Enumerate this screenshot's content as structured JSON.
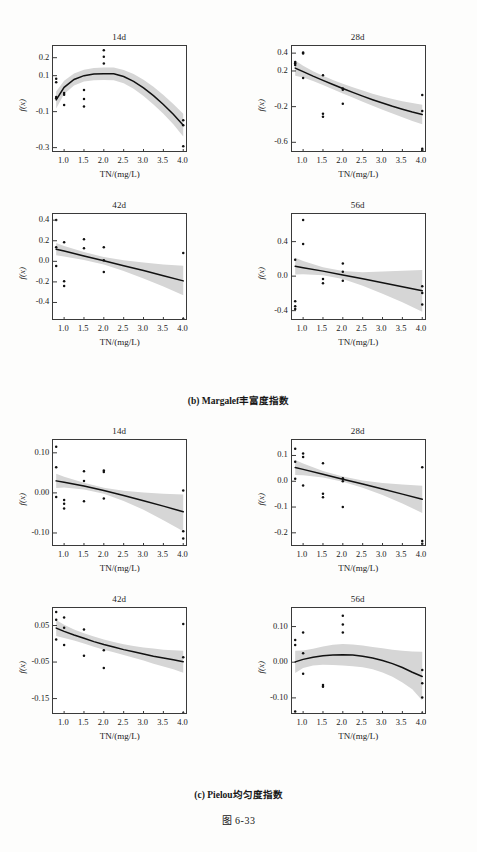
{
  "figure": {
    "number": "图 6-33",
    "sections": [
      {
        "id": "b",
        "caption": "(b) Margalef丰富度指数"
      },
      {
        "id": "c",
        "caption": "(c) Pielou均匀度指数"
      }
    ]
  },
  "axes_common": {
    "xlabel": "TN/(mg/L)",
    "ylabel": "f(x)",
    "xticks": [
      "1.0",
      "1.5",
      "2.0",
      "2.5",
      "3.0",
      "3.5",
      "4.0"
    ],
    "xtick_values": [
      1.0,
      1.5,
      2.0,
      2.5,
      3.0,
      3.5,
      4.0
    ],
    "xlim": [
      0.72,
      4.12
    ]
  },
  "style": {
    "band_color": "#d6d6d6",
    "curve_color": "#111111",
    "point_color": "#111111",
    "frame_color": "#3a3a3a",
    "page_bg": "#fdfdfc"
  },
  "chart_data": [
    {
      "id": "b-14d",
      "type": "line",
      "title": "14d",
      "section": "(b) Margalef丰富度指数",
      "xlabel": "TN/(mg/L)",
      "ylabel": "f(x)",
      "xlim": [
        0.72,
        4.12
      ],
      "ylim": [
        -0.33,
        0.265
      ],
      "yticks": [
        0.2,
        0.1,
        -0.1,
        -0.3
      ],
      "ytick_labels": [
        "0.2",
        "0.1",
        "-0.1",
        "-0.3"
      ],
      "grid": false,
      "legend": "none",
      "fit": {
        "shape": "quadratic-concave",
        "x": [
          0.8,
          1.0,
          1.25,
          1.5,
          1.75,
          2.0,
          2.25,
          2.5,
          2.75,
          3.0,
          3.25,
          3.5,
          3.75,
          4.0
        ],
        "y": [
          -0.035,
          0.035,
          0.079,
          0.1,
          0.109,
          0.111,
          0.11,
          0.095,
          0.068,
          0.032,
          -0.011,
          -0.06,
          -0.114,
          -0.175
        ]
      },
      "band_upper": [
        0.012,
        0.072,
        0.112,
        0.133,
        0.143,
        0.146,
        0.145,
        0.132,
        0.109,
        0.077,
        0.038,
        -0.008,
        -0.058,
        -0.112
      ],
      "band_lower": [
        -0.082,
        -0.002,
        0.046,
        0.067,
        0.075,
        0.076,
        0.075,
        0.058,
        0.027,
        -0.013,
        -0.06,
        -0.112,
        -0.17,
        -0.238
      ],
      "points": [
        {
          "x": 0.8,
          "y": 0.083
        },
        {
          "x": 0.8,
          "y": 0.063
        },
        {
          "x": 0.8,
          "y": -0.018
        },
        {
          "x": 0.8,
          "y": -0.026
        },
        {
          "x": 1.0,
          "y": 0.004
        },
        {
          "x": 1.0,
          "y": -0.006
        },
        {
          "x": 1.0,
          "y": -0.063
        },
        {
          "x": 1.5,
          "y": 0.02
        },
        {
          "x": 1.5,
          "y": -0.03
        },
        {
          "x": 1.5,
          "y": -0.072
        },
        {
          "x": 2.0,
          "y": 0.242
        },
        {
          "x": 2.0,
          "y": 0.205
        },
        {
          "x": 2.0,
          "y": 0.168
        },
        {
          "x": 4.0,
          "y": -0.148
        },
        {
          "x": 4.0,
          "y": -0.175
        },
        {
          "x": 4.0,
          "y": -0.292
        }
      ]
    },
    {
      "id": "b-28d",
      "type": "line",
      "title": "28d",
      "section": "(b) Margalef丰富度指数",
      "xlabel": "TN/(mg/L)",
      "ylabel": "f(x)",
      "xlim": [
        0.72,
        4.12
      ],
      "ylim": [
        -0.72,
        0.48
      ],
      "yticks": [
        0.4,
        0.2,
        -0.2,
        -0.6
      ],
      "ytick_labels": [
        "0.4",
        "0.2",
        "-0.2",
        "-0.6"
      ],
      "grid": false,
      "legend": "none",
      "fit": {
        "shape": "monotone-decreasing-convex",
        "x": [
          0.8,
          1.0,
          1.25,
          1.5,
          1.75,
          2.0,
          2.25,
          2.5,
          2.75,
          3.0,
          3.25,
          3.5,
          3.75,
          4.0
        ],
        "y": [
          0.232,
          0.192,
          0.142,
          0.095,
          0.048,
          0.003,
          -0.04,
          -0.082,
          -0.122,
          -0.16,
          -0.196,
          -0.229,
          -0.26,
          -0.288
        ]
      },
      "band_upper": [
        0.318,
        0.258,
        0.196,
        0.146,
        0.1,
        0.058,
        0.018,
        -0.02,
        -0.055,
        -0.086,
        -0.114,
        -0.139,
        -0.16,
        -0.178
      ],
      "band_lower": [
        0.146,
        0.126,
        0.088,
        0.044,
        -0.004,
        -0.052,
        -0.098,
        -0.144,
        -0.189,
        -0.234,
        -0.278,
        -0.319,
        -0.36,
        -0.398
      ],
      "points": [
        {
          "x": 0.8,
          "y": 0.3
        },
        {
          "x": 0.8,
          "y": 0.286
        },
        {
          "x": 0.8,
          "y": 0.266
        },
        {
          "x": 1.0,
          "y": 0.408
        },
        {
          "x": 1.0,
          "y": 0.396
        },
        {
          "x": 1.0,
          "y": 0.122
        },
        {
          "x": 1.5,
          "y": 0.152
        },
        {
          "x": 1.5,
          "y": -0.28
        },
        {
          "x": 1.5,
          "y": -0.314
        },
        {
          "x": 2.0,
          "y": 0.004
        },
        {
          "x": 2.0,
          "y": -0.01
        },
        {
          "x": 2.0,
          "y": -0.168
        },
        {
          "x": 4.0,
          "y": -0.07
        },
        {
          "x": 4.0,
          "y": -0.25
        },
        {
          "x": 4.0,
          "y": -0.672
        },
        {
          "x": 4.0,
          "y": -0.69
        }
      ]
    },
    {
      "id": "b-42d",
      "type": "line",
      "title": "42d",
      "section": "(b) Margalef丰富度指数",
      "xlabel": "TN/(mg/L)",
      "ylabel": "f(x)",
      "xlim": [
        0.72,
        4.12
      ],
      "ylim": [
        -0.58,
        0.46
      ],
      "yticks": [
        0.4,
        0.2,
        0.0,
        -0.2,
        -0.4
      ],
      "ytick_labels": [
        "0.4",
        "0.2",
        "0.0",
        "-0.2",
        "-0.4"
      ],
      "grid": false,
      "legend": "none",
      "fit": {
        "shape": "linear-decreasing",
        "x": [
          0.8,
          1.0,
          1.5,
          2.0,
          2.5,
          3.0,
          3.5,
          4.0
        ],
        "y": [
          0.118,
          0.1,
          0.052,
          0.006,
          -0.042,
          -0.09,
          -0.14,
          -0.19
        ]
      },
      "band_upper": [
        0.178,
        0.15,
        0.09,
        0.042,
        0.01,
        -0.012,
        -0.03,
        -0.044
      ],
      "band_lower": [
        0.06,
        0.048,
        0.012,
        -0.03,
        -0.094,
        -0.166,
        -0.244,
        -0.33
      ],
      "points": [
        {
          "x": 0.8,
          "y": 0.402
        },
        {
          "x": 0.8,
          "y": 0.138
        },
        {
          "x": 0.8,
          "y": -0.046
        },
        {
          "x": 1.0,
          "y": 0.186
        },
        {
          "x": 1.0,
          "y": -0.194
        },
        {
          "x": 1.0,
          "y": -0.24
        },
        {
          "x": 1.5,
          "y": 0.214
        },
        {
          "x": 1.5,
          "y": 0.126
        },
        {
          "x": 2.0,
          "y": 0.136
        },
        {
          "x": 2.0,
          "y": 0.01
        },
        {
          "x": 2.0,
          "y": -0.104
        },
        {
          "x": 4.0,
          "y": 0.08
        },
        {
          "x": 4.0,
          "y": -0.56
        }
      ]
    },
    {
      "id": "b-56d",
      "type": "line",
      "title": "56d",
      "section": "(b) Margalef丰富度指数",
      "xlabel": "TN/(mg/L)",
      "ylabel": "f(x)",
      "xlim": [
        0.72,
        4.12
      ],
      "ylim": [
        -0.52,
        0.72
      ],
      "yticks": [
        0.4,
        0.0,
        -0.4
      ],
      "ytick_labels": [
        "0.4",
        "0.0",
        "-0.4"
      ],
      "grid": false,
      "legend": "none",
      "fit": {
        "shape": "linear-decreasing",
        "x": [
          0.8,
          1.0,
          1.5,
          2.0,
          2.5,
          3.0,
          3.5,
          4.0
        ],
        "y": [
          0.114,
          0.098,
          0.058,
          0.014,
          -0.03,
          -0.076,
          -0.122,
          -0.17
        ]
      },
      "band_upper": [
        0.212,
        0.176,
        0.104,
        0.058,
        0.046,
        0.054,
        0.062,
        0.07
      ],
      "band_lower": [
        0.02,
        0.022,
        0.01,
        -0.034,
        -0.112,
        -0.204,
        -0.304,
        -0.412
      ],
      "points": [
        {
          "x": 0.8,
          "y": 0.19
        },
        {
          "x": 0.8,
          "y": -0.29
        },
        {
          "x": 0.8,
          "y": -0.35
        },
        {
          "x": 0.8,
          "y": -0.382
        },
        {
          "x": 1.0,
          "y": 0.65
        },
        {
          "x": 1.0,
          "y": 0.372
        },
        {
          "x": 1.5,
          "y": -0.034
        },
        {
          "x": 1.5,
          "y": -0.082
        },
        {
          "x": 2.0,
          "y": 0.146
        },
        {
          "x": 2.0,
          "y": 0.05
        },
        {
          "x": 2.0,
          "y": -0.054
        },
        {
          "x": 4.0,
          "y": -0.118
        },
        {
          "x": 4.0,
          "y": -0.196
        },
        {
          "x": 4.0,
          "y": -0.33
        }
      ]
    },
    {
      "id": "c-14d",
      "type": "line",
      "title": "14d",
      "section": "(c) Pielou均匀度指数",
      "xlabel": "TN/(mg/L)",
      "ylabel": "f(x)",
      "xlim": [
        0.72,
        4.12
      ],
      "ylim": [
        -0.135,
        0.132
      ],
      "yticks": [
        0.1,
        0.0,
        -0.1
      ],
      "ytick_labels": [
        "0.10",
        "0.00",
        "-0.10"
      ],
      "grid": false,
      "legend": "none",
      "fit": {
        "shape": "linear-decreasing",
        "x": [
          0.8,
          1.0,
          1.5,
          2.0,
          2.5,
          3.0,
          3.5,
          4.0
        ],
        "y": [
          0.03,
          0.0268,
          0.0172,
          0.0058,
          -0.0066,
          -0.0196,
          -0.033,
          -0.047
        ]
      },
      "band_upper": [
        0.048,
        0.04,
        0.0256,
        0.013,
        0.0056,
        0.001,
        -0.002,
        -0.004
      ],
      "band_lower": [
        0.012,
        0.0134,
        0.0086,
        -0.002,
        -0.02,
        -0.042,
        -0.068,
        -0.096
      ],
      "points": [
        {
          "x": 0.8,
          "y": 0.115
        },
        {
          "x": 0.8,
          "y": 0.064
        },
        {
          "x": 0.8,
          "y": -0.01
        },
        {
          "x": 1.0,
          "y": -0.018
        },
        {
          "x": 1.0,
          "y": -0.027
        },
        {
          "x": 1.0,
          "y": -0.039
        },
        {
          "x": 1.5,
          "y": 0.054
        },
        {
          "x": 1.5,
          "y": 0.03
        },
        {
          "x": 1.5,
          "y": -0.021
        },
        {
          "x": 2.0,
          "y": 0.056
        },
        {
          "x": 2.0,
          "y": 0.052
        },
        {
          "x": 2.0,
          "y": -0.014
        },
        {
          "x": 4.0,
          "y": 0.006
        },
        {
          "x": 4.0,
          "y": -0.096
        },
        {
          "x": 4.0,
          "y": -0.114
        }
      ]
    },
    {
      "id": "c-28d",
      "type": "line",
      "title": "28d",
      "section": "(c) Pielou均匀度指数",
      "xlabel": "TN/(mg/L)",
      "ylabel": "f(x)",
      "xlim": [
        0.72,
        4.12
      ],
      "ylim": [
        -0.255,
        0.16
      ],
      "yticks": [
        0.1,
        0.0,
        -0.1,
        -0.2
      ],
      "ytick_labels": [
        "0.1",
        "0.0",
        "-0.1",
        "-0.2"
      ],
      "grid": false,
      "legend": "none",
      "fit": {
        "shape": "linear-decreasing",
        "x": [
          0.8,
          1.0,
          1.5,
          2.0,
          2.5,
          3.0,
          3.5,
          4.0
        ],
        "y": [
          0.053,
          0.046,
          0.0272,
          0.008,
          -0.011,
          -0.03,
          -0.05,
          -0.07
        ]
      },
      "band_upper": [
        0.082,
        0.069,
        0.04,
        0.018,
        0.003,
        -0.007,
        -0.013,
        -0.017
      ],
      "band_lower": [
        0.024,
        0.023,
        0.0144,
        -0.002,
        -0.025,
        -0.053,
        -0.086,
        -0.123
      ],
      "points": [
        {
          "x": 0.8,
          "y": 0.126
        },
        {
          "x": 0.8,
          "y": 0.076
        },
        {
          "x": 0.8,
          "y": 0.01
        },
        {
          "x": 1.0,
          "y": 0.108
        },
        {
          "x": 1.0,
          "y": 0.094
        },
        {
          "x": 1.0,
          "y": -0.016
        },
        {
          "x": 1.5,
          "y": 0.07
        },
        {
          "x": 1.5,
          "y": -0.048
        },
        {
          "x": 1.5,
          "y": -0.062
        },
        {
          "x": 2.0,
          "y": 0.012
        },
        {
          "x": 2.0,
          "y": 0.0
        },
        {
          "x": 2.0,
          "y": -0.1
        },
        {
          "x": 4.0,
          "y": 0.054
        },
        {
          "x": 4.0,
          "y": -0.232
        },
        {
          "x": 4.0,
          "y": -0.242
        }
      ]
    },
    {
      "id": "c-42d",
      "type": "line",
      "title": "42d",
      "section": "(c) Pielou均匀度指数",
      "xlabel": "TN/(mg/L)",
      "ylabel": "f(x)",
      "xlim": [
        0.72,
        4.12
      ],
      "ylim": [
        -0.195,
        0.098
      ],
      "yticks": [
        0.05,
        -0.05,
        -0.15
      ],
      "ytick_labels": [
        "0.05",
        "-0.05",
        "-0.15"
      ],
      "grid": false,
      "legend": "none",
      "fit": {
        "shape": "monotone-decreasing-convex",
        "x": [
          0.8,
          1.0,
          1.25,
          1.5,
          1.75,
          2.0,
          2.25,
          2.5,
          2.75,
          3.0,
          3.25,
          3.5,
          3.75,
          4.0
        ],
        "y": [
          0.043,
          0.034,
          0.024,
          0.015,
          0.006,
          -0.002,
          -0.009,
          -0.016,
          -0.022,
          -0.028,
          -0.034,
          -0.039,
          -0.044,
          -0.049
        ]
      },
      "band_upper": [
        0.065,
        0.052,
        0.039,
        0.029,
        0.02,
        0.012,
        0.005,
        -0.001,
        -0.006,
        -0.01,
        -0.013,
        -0.016,
        -0.018,
        -0.019
      ],
      "band_lower": [
        0.021,
        0.016,
        0.009,
        0.001,
        -0.008,
        -0.016,
        -0.023,
        -0.031,
        -0.038,
        -0.046,
        -0.055,
        -0.062,
        -0.07,
        -0.079
      ],
      "points": [
        {
          "x": 0.8,
          "y": 0.087
        },
        {
          "x": 0.8,
          "y": 0.066
        },
        {
          "x": 0.8,
          "y": 0.012
        },
        {
          "x": 1.0,
          "y": 0.072
        },
        {
          "x": 1.0,
          "y": 0.044
        },
        {
          "x": 1.0,
          "y": -0.003
        },
        {
          "x": 1.5,
          "y": 0.039
        },
        {
          "x": 1.5,
          "y": -0.033
        },
        {
          "x": 2.0,
          "y": -0.018
        },
        {
          "x": 2.0,
          "y": -0.066
        },
        {
          "x": 4.0,
          "y": 0.054
        },
        {
          "x": 4.0,
          "y": -0.037
        },
        {
          "x": 4.0,
          "y": -0.19
        }
      ]
    },
    {
      "id": "c-56d",
      "type": "line",
      "title": "56d",
      "section": "(c) Pielou均匀度指数",
      "xlabel": "TN/(mg/L)",
      "ylabel": "f(x)",
      "xlim": [
        0.72,
        4.12
      ],
      "ylim": [
        -0.148,
        0.152
      ],
      "yticks": [
        0.1,
        0.0,
        -0.1
      ],
      "ytick_labels": [
        "0.10",
        "0.00",
        "-0.10"
      ],
      "grid": false,
      "legend": "none",
      "fit": {
        "shape": "quadratic-concave",
        "x": [
          0.8,
          1.0,
          1.25,
          1.5,
          1.75,
          2.0,
          2.25,
          2.5,
          2.75,
          3.0,
          3.25,
          3.5,
          3.75,
          4.0
        ],
        "y": [
          0.001,
          0.008,
          0.014,
          0.018,
          0.02,
          0.021,
          0.02,
          0.017,
          0.012,
          0.005,
          -0.004,
          -0.015,
          -0.028,
          -0.04
        ]
      },
      "band_upper": [
        0.032,
        0.033,
        0.038,
        0.044,
        0.049,
        0.051,
        0.05,
        0.047,
        0.043,
        0.039,
        0.035,
        0.032,
        0.03,
        0.029
      ],
      "band_lower": [
        -0.03,
        -0.016,
        -0.009,
        -0.007,
        -0.008,
        -0.009,
        -0.011,
        -0.014,
        -0.02,
        -0.029,
        -0.041,
        -0.057,
        -0.076,
        -0.107
      ],
      "points": [
        {
          "x": 0.8,
          "y": 0.062
        },
        {
          "x": 0.8,
          "y": 0.048
        },
        {
          "x": 0.8,
          "y": -0.138
        },
        {
          "x": 1.0,
          "y": 0.083
        },
        {
          "x": 1.0,
          "y": 0.025
        },
        {
          "x": 1.0,
          "y": -0.032
        },
        {
          "x": 1.5,
          "y": -0.064
        },
        {
          "x": 1.5,
          "y": -0.069
        },
        {
          "x": 2.0,
          "y": 0.13
        },
        {
          "x": 2.0,
          "y": 0.106
        },
        {
          "x": 2.0,
          "y": 0.083
        },
        {
          "x": 4.0,
          "y": -0.022
        },
        {
          "x": 4.0,
          "y": -0.059
        },
        {
          "x": 4.0,
          "y": -0.099
        },
        {
          "x": 4.0,
          "y": -0.144
        }
      ]
    }
  ]
}
